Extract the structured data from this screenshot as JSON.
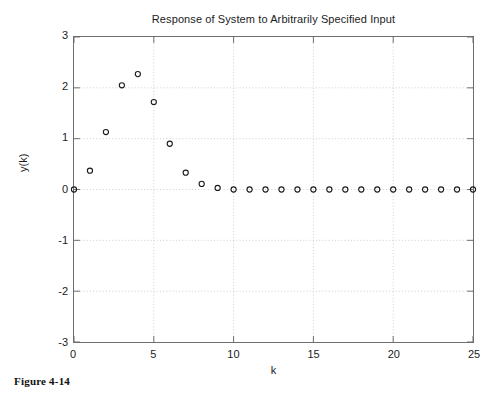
{
  "caption": "Figure 4-14",
  "chart_data": {
    "type": "scatter",
    "title": "Response of System to Arbitrarily Specified Input",
    "xlabel": "k",
    "ylabel": "y(k)",
    "xlim": [
      0,
      25
    ],
    "ylim": [
      -3,
      3
    ],
    "xticks": [
      0,
      5,
      10,
      15,
      20,
      25
    ],
    "yticks": [
      3,
      2,
      1,
      0,
      -1,
      -2,
      -3
    ],
    "xtick_labels": [
      "0",
      "5",
      "10",
      "15",
      "20",
      "25"
    ],
    "ytick_labels": [
      "3",
      "2",
      "1",
      "0",
      "-1",
      "-2",
      "-3"
    ],
    "grid": true,
    "grid_style": "dotted",
    "legend": null,
    "marker": "circle-open",
    "marker_color": "#1a1a1a",
    "x": [
      0,
      1,
      2,
      3,
      4,
      5,
      6,
      7,
      8,
      9,
      10,
      11,
      12,
      13,
      14,
      15,
      16,
      17,
      18,
      19,
      20,
      21,
      22,
      23,
      24,
      25
    ],
    "values": [
      0,
      0.37,
      1.13,
      2.05,
      2.27,
      1.72,
      0.9,
      0.33,
      0.11,
      0.03,
      0,
      0,
      0,
      0,
      0,
      0,
      0,
      0,
      0,
      0,
      0,
      0,
      0,
      0,
      0,
      0
    ]
  }
}
